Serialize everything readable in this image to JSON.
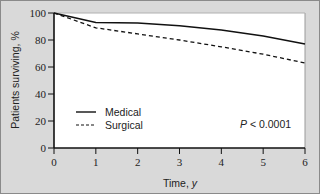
{
  "chart_data": {
    "type": "line",
    "title": "",
    "xlabel": "Time, y",
    "ylabel": "Patients surviving, %",
    "xlim": [
      0,
      6
    ],
    "ylim": [
      0,
      100
    ],
    "x_ticks": [
      "0",
      "1",
      "2",
      "3",
      "4",
      "5",
      "6"
    ],
    "y_ticks": [
      "0",
      "20",
      "40",
      "60",
      "80",
      "100"
    ],
    "grid": false,
    "legend_position": "lower left",
    "series": [
      {
        "name": "Medical",
        "style": "solid",
        "x": [
          0,
          1,
          2,
          3,
          4,
          5,
          6
        ],
        "values": [
          100,
          93,
          92.5,
          90.5,
          87.5,
          83,
          77
        ]
      },
      {
        "name": "Surgical",
        "style": "dashed",
        "x": [
          0,
          1,
          2,
          3,
          4,
          5,
          6
        ],
        "values": [
          100,
          89,
          84.5,
          80,
          75,
          69.5,
          63
        ]
      }
    ],
    "annotations": [
      "P < 0.0001"
    ]
  },
  "legend": {
    "medical": "Medical",
    "surgical": "Surgical"
  },
  "annotation": {
    "p_prefix": "P",
    "p_value": " < 0.0001"
  }
}
